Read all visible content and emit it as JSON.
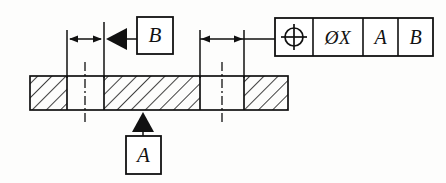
{
  "drawing": {
    "title": "GD&T Positional Tolerance Section View",
    "type": "engineering-drawing",
    "background_color": "#fdfdfc",
    "line_color": "#111111",
    "fill_color": "#000000"
  },
  "part": {
    "name": "sectioned-plate",
    "hatch_angle_deg": 45,
    "segments": [
      {
        "name": "hatch-left",
        "x": 30,
        "width": 37,
        "hatched": true
      },
      {
        "name": "hole-left",
        "x": 67,
        "width": 37,
        "hatched": false
      },
      {
        "name": "hatch-middle",
        "x": 104,
        "width": 96,
        "hatched": true
      },
      {
        "name": "hole-right",
        "x": 200,
        "width": 44,
        "hatched": false
      },
      {
        "name": "hatch-right",
        "x": 244,
        "width": 44,
        "hatched": true
      }
    ],
    "top_y": 76,
    "bottom_y": 110
  },
  "centerlines": [
    {
      "name": "centerline-hole-left",
      "x": 85
    },
    {
      "name": "centerline-hole-right",
      "x": 222
    }
  ],
  "dimensions": [
    {
      "name": "dimension-left",
      "arrow_direction": "outward",
      "y": 39,
      "from_x": 67,
      "to_x": 104,
      "value": ""
    },
    {
      "name": "dimension-right",
      "arrow_direction": "inward",
      "y": 39,
      "from_x": 200,
      "to_x": 244,
      "value": ""
    }
  ],
  "datum_symbols": [
    {
      "name": "datum-feature-b",
      "label": "B",
      "triangle": "filled",
      "direction": "left",
      "box": {
        "x": 137,
        "y": 17,
        "w": 36,
        "h": 37
      }
    },
    {
      "name": "datum-feature-a",
      "label": "A",
      "triangle": "filled",
      "direction": "up",
      "box": {
        "x": 126,
        "y": 136,
        "w": 35,
        "h": 38
      }
    }
  ],
  "feature_control_frame": {
    "name": "feature-control-frame",
    "x": 275,
    "y": 18,
    "height": 38,
    "leader_from_x": 244,
    "cells": [
      {
        "name": "position-symbol-cell",
        "type": "symbol",
        "symbol": "position-crosshair-icon",
        "label": "",
        "width": 38
      },
      {
        "name": "tolerance-value-cell",
        "type": "text",
        "label": "ØX",
        "width": 50
      },
      {
        "name": "primary-datum-cell",
        "type": "text",
        "label": "A",
        "width": 35
      },
      {
        "name": "secondary-datum-cell",
        "type": "text",
        "label": "B",
        "width": 35
      }
    ]
  }
}
